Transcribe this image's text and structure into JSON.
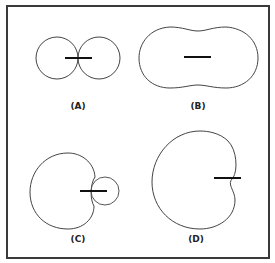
{
  "figures": [
    {
      "id": "A",
      "label": "(A)",
      "description": "figure-eight (two tangent circles) with horizontal element"
    },
    {
      "id": "B",
      "label": "(B)",
      "description": "peanut-shaped pattern with horizontal element"
    },
    {
      "id": "C",
      "label": "(C)",
      "description": "cardioid with small rear lobe circle"
    },
    {
      "id": "D",
      "label": "(D)",
      "description": "cardioid pattern"
    }
  ],
  "colors": {
    "stroke": "#444444",
    "element": "#111111",
    "border": "#3a3a3a"
  }
}
